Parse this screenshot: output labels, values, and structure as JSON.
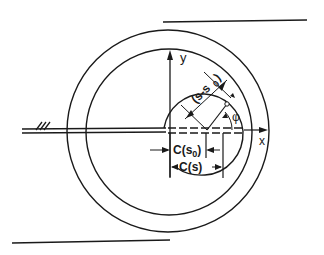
{
  "diagram": {
    "type": "wound-roll cross-section",
    "colors": {
      "line": "#1a1a1a",
      "background": "#ffffff"
    },
    "labels": {
      "y_axis": "y",
      "x_axis": "x",
      "phi": "φ",
      "s_minus_s0": "(s-s",
      "s_minus_s0_sub": "0",
      "s_minus_s0_close": ")",
      "c_s0": "C(s",
      "c_s0_sub": "0",
      "c_s0_close": ")",
      "c_s": "C(s)",
      "hatch": "///"
    }
  }
}
